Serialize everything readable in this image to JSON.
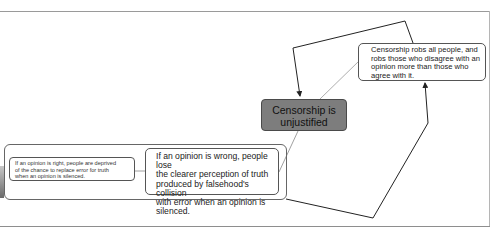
{
  "diagram": {
    "type": "argument-map",
    "central_node": {
      "label": "Censorship is unjustified",
      "line1": "Censorship is",
      "line2": "unjustified",
      "fill": "#7d7d7d"
    },
    "nodes": [
      {
        "id": "wrong",
        "text": "If an opinion is wrong, people lose the clearer perception of truth produced by falsehood's collision with error when an opinion is silenced.",
        "lines": [
          "If an opinion is wrong, people lose",
          "the clearer perception of truth",
          "produced by falsehood's collision",
          "with error when an opinion is",
          "silenced."
        ]
      },
      {
        "id": "right",
        "text": "If an opinion is right, people are deprived of the chance to replace error for truth when an opinion is silenced.",
        "lines": [
          "If an opinion is right, people are deprived",
          "of the chance to replace error for truth",
          "when an opinion is silenced."
        ]
      },
      {
        "id": "robs",
        "text": "Censorship robs all people, and robs those who disagree with an opinion more than those who agree with it.",
        "lines": [
          "Censorship robs all people, and",
          "robs those who disagree with an",
          "opinion more than those who",
          "agree with it."
        ]
      }
    ],
    "edges": [
      {
        "from": "wrong",
        "to": "central",
        "style": "thin-line"
      },
      {
        "from": "robs",
        "to": "central",
        "style": "thin-line"
      },
      {
        "from": "right",
        "to": "wrong",
        "style": "thin-line"
      },
      {
        "from": "group",
        "to": "robs",
        "style": "arrow"
      },
      {
        "from": "robs",
        "to": "central",
        "style": "arrow"
      }
    ]
  }
}
